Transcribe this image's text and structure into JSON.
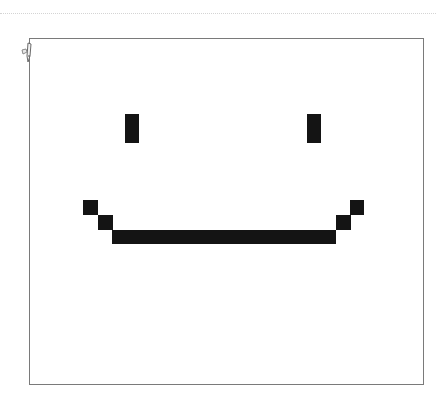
{
  "app": {
    "type": "pixel-drawing-canvas"
  },
  "canvas": {
    "background": "#ffffff",
    "border_color": "#7a7a7a",
    "drawing_color": "#141414",
    "drawing": "smiley-face"
  },
  "cursor": {
    "icon": "pencil-icon"
  },
  "pixels": {
    "left_eye": {
      "x": 125,
      "y": 114,
      "w": 14,
      "h": 29
    },
    "right_eye": {
      "x": 307,
      "y": 114,
      "w": 14,
      "h": 29
    },
    "mouth_left_top": {
      "x": 83,
      "y": 200,
      "w": 15,
      "h": 15
    },
    "mouth_left_mid": {
      "x": 98,
      "y": 215,
      "w": 15,
      "h": 15
    },
    "mouth_bar": {
      "x": 112,
      "y": 230,
      "w": 224,
      "h": 14
    },
    "mouth_right_mid": {
      "x": 336,
      "y": 215,
      "w": 15,
      "h": 15
    },
    "mouth_right_top": {
      "x": 350,
      "y": 200,
      "w": 14,
      "h": 15
    }
  }
}
